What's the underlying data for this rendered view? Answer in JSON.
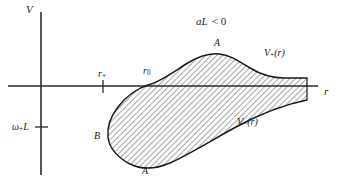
{
  "figure": {
    "kind": "effective-potential-diagram",
    "background_color": "#ffffff",
    "ink_color": "#1a1a1a",
    "axes": {
      "vertical_label": "V",
      "horizontal_label": "r",
      "origin_px": [
        41,
        86
      ],
      "vertical_axis_extent_px": [
        12,
        175
      ],
      "horizontal_axis_extent_px": [
        8,
        318
      ]
    },
    "ticks": [
      {
        "name": "r-plus-tick",
        "label_base": "r",
        "label_sub": "+",
        "x_px": 103,
        "axis": "horizontal"
      },
      {
        "name": "r-zero-tick",
        "label_base": "r",
        "label_sub": "0",
        "x_px": 148,
        "axis": "horizontal"
      },
      {
        "name": "omega-L-tick",
        "label_base": "ω",
        "label_sub": "+",
        "label_tail": "L",
        "y_px": 127,
        "axis": "vertical"
      }
    ],
    "annotations": {
      "condition_prefix": "aL",
      "condition_relation": "<",
      "condition_value": "0",
      "condition_full": "aL < 0",
      "point_A": "A",
      "point_B": "B",
      "point_A_prime": "A′",
      "curve_upper_base": "V",
      "curve_upper_sub": "+",
      "curve_upper_arg": "(r)",
      "curve_upper_full": "V₊(r)",
      "curve_lower_base": "V",
      "curve_lower_sub": "−",
      "curve_lower_arg": "(r)",
      "curve_lower_full": "V₋(r)"
    },
    "hatch": {
      "style": "diagonal-lines",
      "angle_deg": 45,
      "spacing_px": 4,
      "stroke_width_px": 0.8
    },
    "curves": {
      "upper_v_plus_path": "M 148 85 C 160 82 172 73 186 64 C 199 56 209 53 219 54 C 231 55 240 62 250 68 C 260 74 272 78 284 78 C 293 78 300 78 307 78",
      "lower_v_minus_path": "M 148 85 C 138 88 126 96 118 107 C 111 116 107 127 108 137 C 109 148 118 158 130 164 C 142 170 156 169 170 163 C 190 154 212 140 236 127 C 258 115 282 105 307 100",
      "closing_edge": "M 307 78 L 307 100"
    }
  }
}
